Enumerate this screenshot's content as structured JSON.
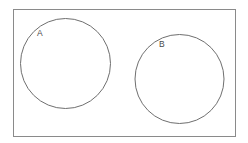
{
  "diagram": {
    "kind": "venn-diagram",
    "title": "",
    "relation": "disjoint",
    "canvas": {
      "width": 248,
      "height": 143,
      "background_color": "#ffffff"
    },
    "universal_set": {
      "name": "universal-set-rectangle",
      "label": "",
      "x": 13,
      "y": 9,
      "width": 223,
      "height": 128,
      "stroke_color": "#8a8a8a",
      "stroke_width": 1,
      "fill_color": "#ffffff"
    },
    "sets": [
      {
        "label": "A",
        "name": "set-a",
        "center_x": 65.5,
        "center_y": 63.5,
        "radius": 45.5,
        "stroke_color": "#6f6f6f",
        "stroke_width": 1,
        "fill_color": "#ffffff",
        "label_x": 37,
        "label_y": 30
      },
      {
        "label": "B",
        "name": "set-b",
        "center_x": 179.5,
        "center_y": 79,
        "radius": 45,
        "stroke_color": "#6f6f6f",
        "stroke_width": 1,
        "fill_color": "#ffffff",
        "label_x": 159,
        "label_y": 41
      }
    ]
  }
}
